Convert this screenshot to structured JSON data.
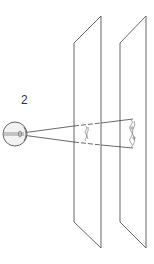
{
  "figure": {
    "label": "2"
  },
  "colors": {
    "line": "#555555",
    "eye_fill": "#f2f2f2",
    "background": "#ffffff"
  },
  "elements": {
    "eye": {
      "cx": 15,
      "cy": 134,
      "r": 12
    },
    "planes": [
      {
        "name": "near-plane",
        "top_left": [
          74,
          43
        ],
        "top_right": [
          101,
          16
        ],
        "bottom_left": [
          74,
          222
        ],
        "bottom_right": [
          101,
          248
        ]
      },
      {
        "name": "far-plane",
        "top_left": [
          120,
          43
        ],
        "top_right": [
          146,
          16
        ],
        "bottom_left": [
          120,
          222
        ],
        "bottom_right": [
          146,
          248
        ]
      }
    ],
    "visual_cone": {
      "apex": [
        22,
        134
      ],
      "far_top": [
        133,
        119
      ],
      "far_bottom": [
        133,
        148
      ]
    }
  }
}
